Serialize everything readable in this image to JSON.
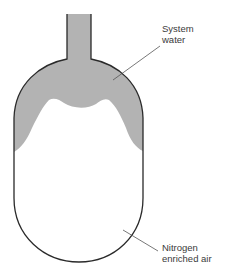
{
  "diagram": {
    "type": "expansion-vessel-cross-section",
    "colors": {
      "water_fill": "#b3b3b3",
      "outline": "#2a2a2a",
      "leader": "#555555",
      "background": "#ffffff"
    },
    "labels": {
      "system_water": {
        "line1": "System",
        "line2": "water"
      },
      "nitrogen_air": {
        "line1": "Nitrogen",
        "line2": "enriched air"
      }
    }
  }
}
